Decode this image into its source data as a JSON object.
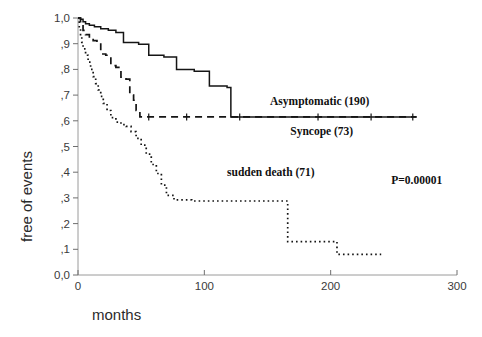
{
  "chart_data": {
    "type": "line",
    "title": "",
    "subtitle": "",
    "xlabel": "months",
    "ylabel": "free of events",
    "xlim": [
      0,
      300
    ],
    "ylim": [
      0.0,
      1.0
    ],
    "grid": false,
    "legend_position": "inline-annotations",
    "x_ticks": [
      0,
      100,
      200,
      300
    ],
    "x_tick_labels": [
      "0",
      "100",
      "200",
      "300"
    ],
    "y_ticks": [
      0.0,
      0.1,
      0.2,
      0.3,
      0.4,
      0.5,
      0.6,
      0.7,
      0.8,
      0.9,
      1.0
    ],
    "y_tick_labels": [
      "0,0",
      ",1",
      ",2",
      ",3",
      ",4",
      ",5",
      ",6",
      ",7",
      ",8",
      ",9",
      "1,0"
    ],
    "annotations": [
      {
        "text": "Asymptomatic (190)",
        "x": 152,
        "y": 0.66
      },
      {
        "text": "Syncope (73)",
        "x": 168,
        "y": 0.545
      },
      {
        "text": "sudden death (71)",
        "x": 118,
        "y": 0.385
      },
      {
        "text": "P=0.00001",
        "x": 248,
        "y": 0.355
      }
    ],
    "series": [
      {
        "name": "Asymptomatic (190)",
        "n": 190,
        "style": "solid",
        "points": [
          [
            0,
            1.0
          ],
          [
            2,
            0.995
          ],
          [
            4,
            0.985
          ],
          [
            6,
            0.978
          ],
          [
            9,
            0.972
          ],
          [
            13,
            0.966
          ],
          [
            18,
            0.958
          ],
          [
            24,
            0.952
          ],
          [
            30,
            0.944
          ],
          [
            36,
            0.905
          ],
          [
            48,
            0.898
          ],
          [
            56,
            0.855
          ],
          [
            68,
            0.848
          ],
          [
            78,
            0.8
          ],
          [
            92,
            0.793
          ],
          [
            104,
            0.735
          ],
          [
            118,
            0.73
          ],
          [
            121,
            0.615
          ],
          [
            150,
            0.615
          ],
          [
            190,
            0.615
          ],
          [
            232,
            0.615
          ],
          [
            268,
            0.615
          ]
        ]
      },
      {
        "name": "Syncope (73)",
        "n": 73,
        "style": "dashed",
        "points": [
          [
            0,
            1.0
          ],
          [
            2,
            0.975
          ],
          [
            4,
            0.952
          ],
          [
            6,
            0.935
          ],
          [
            9,
            0.92
          ],
          [
            12,
            0.912
          ],
          [
            15,
            0.905
          ],
          [
            18,
            0.86
          ],
          [
            22,
            0.855
          ],
          [
            26,
            0.815
          ],
          [
            30,
            0.808
          ],
          [
            34,
            0.77
          ],
          [
            38,
            0.762
          ],
          [
            41,
            0.7
          ],
          [
            44,
            0.68
          ],
          [
            46,
            0.64
          ],
          [
            49,
            0.615
          ],
          [
            80,
            0.615
          ],
          [
            130,
            0.615
          ],
          [
            180,
            0.615
          ],
          [
            230,
            0.615
          ],
          [
            268,
            0.615
          ]
        ]
      },
      {
        "name": "sudden death (71)",
        "n": 71,
        "style": "dotted",
        "points": [
          [
            0,
            1.0
          ],
          [
            1,
            0.96
          ],
          [
            2,
            0.93
          ],
          [
            3,
            0.905
          ],
          [
            4,
            0.88
          ],
          [
            6,
            0.855
          ],
          [
            8,
            0.828
          ],
          [
            10,
            0.8
          ],
          [
            12,
            0.772
          ],
          [
            14,
            0.745
          ],
          [
            16,
            0.72
          ],
          [
            18,
            0.695
          ],
          [
            20,
            0.668
          ],
          [
            23,
            0.64
          ],
          [
            26,
            0.612
          ],
          [
            30,
            0.595
          ],
          [
            34,
            0.585
          ],
          [
            38,
            0.578
          ],
          [
            42,
            0.558
          ],
          [
            46,
            0.532
          ],
          [
            50,
            0.505
          ],
          [
            54,
            0.47
          ],
          [
            58,
            0.43
          ],
          [
            62,
            0.395
          ],
          [
            66,
            0.35
          ],
          [
            70,
            0.31
          ],
          [
            76,
            0.292
          ],
          [
            90,
            0.288
          ],
          [
            110,
            0.288
          ],
          [
            147,
            0.288
          ],
          [
            166,
            0.288
          ],
          [
            166,
            0.13
          ],
          [
            200,
            0.13
          ],
          [
            205,
            0.13
          ],
          [
            205,
            0.08
          ],
          [
            240,
            0.08
          ]
        ]
      }
    ]
  },
  "axes": {
    "x_axis_title": "months",
    "y_axis_title": "free of events"
  }
}
